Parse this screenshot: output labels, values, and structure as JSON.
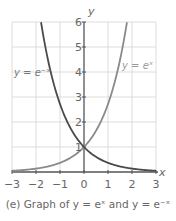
{
  "chart_data": {
    "type": "line",
    "title": "",
    "caption": "(e) Graph of y = eˣ and y = e⁻ˣ",
    "xlabel": "x",
    "ylabel": "y",
    "xlim": [
      -3,
      3
    ],
    "ylim": [
      0,
      6
    ],
    "grid": true,
    "x_ticks": [
      "−3",
      "−2",
      "−1",
      "0",
      "1",
      "2",
      "3"
    ],
    "y_ticks": [
      "1",
      "2",
      "3",
      "4",
      "5",
      "6"
    ],
    "series": [
      {
        "name": "y = e^x",
        "label": "y = eˣ",
        "color": "#8a8a8a",
        "x": [
          -3,
          -2,
          -1,
          0,
          1,
          1.5,
          1.79
        ],
        "values": [
          0.05,
          0.14,
          0.37,
          1,
          2.72,
          4.48,
          6
        ]
      },
      {
        "name": "y = e^-x",
        "label": "y = e⁻ˣ",
        "color": "#4a4a4a",
        "x": [
          -1.79,
          -1.5,
          -1,
          0,
          1,
          2,
          3
        ],
        "values": [
          6,
          4.48,
          2.72,
          1,
          0.37,
          0.14,
          0.05
        ]
      }
    ],
    "annotations": [
      {
        "text": "y = e⁻ˣ",
        "near": [
          -2.7,
          4
        ]
      },
      {
        "text": "y = eˣ",
        "near": [
          2.2,
          4.3
        ]
      }
    ]
  },
  "labels": {
    "x_axis": "x",
    "y_axis": "y",
    "curve_exp_neg": "y = e⁻ˣ",
    "curve_exp_pos": "y = eˣ",
    "caption": "(e) Graph of y = eˣ and y = e⁻ˣ"
  }
}
